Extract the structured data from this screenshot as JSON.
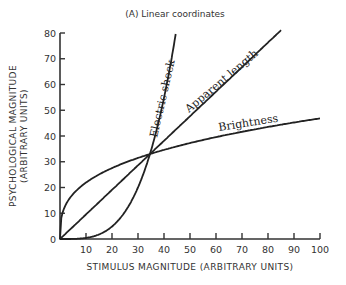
{
  "chart_data": {
    "type": "line",
    "title": "(A) Linear coordinates",
    "xlabel": "STIMULUS MAGNITUDE (ARBITRARY UNITS)",
    "ylabel_line1": "PSYCHOLOGICAL MAGNITUDE",
    "ylabel_line2": "(ARBITRARY UNITS)",
    "xlim": [
      0,
      100
    ],
    "ylim": [
      0,
      80
    ],
    "x_ticks": [
      10,
      20,
      30,
      40,
      50,
      60,
      70,
      80,
      90,
      100
    ],
    "y_ticks": [
      0,
      10,
      20,
      30,
      40,
      50,
      60,
      70,
      80
    ],
    "x_origin_label": "0",
    "grid": false,
    "legend": "inline labels on curves",
    "series": [
      {
        "name": "Electric shock",
        "function": "power, exponent ~3.5",
        "x": [
          0,
          10,
          20,
          25,
          30,
          34.6,
          38,
          40,
          42,
          44.5
        ],
        "y": [
          0,
          0.4,
          4.4,
          10.2,
          20.3,
          33,
          46.2,
          55.6,
          66.5,
          80
        ]
      },
      {
        "name": "Apparent length",
        "function": "power, exponent ~1.0",
        "x": [
          0,
          34.6,
          50,
          85
        ],
        "y": [
          0,
          33,
          47.6,
          80
        ]
      },
      {
        "name": "Brightness",
        "function": "power, exponent ~0.33",
        "x": [
          0,
          1,
          5,
          10,
          20,
          34.6,
          50,
          70,
          100
        ],
        "y": [
          0,
          10.3,
          17.4,
          21.9,
          27.6,
          33,
          37.3,
          41.7,
          46.9
        ]
      }
    ],
    "annotations": {
      "intersection": {
        "x": 34.6,
        "y": 33
      }
    }
  }
}
